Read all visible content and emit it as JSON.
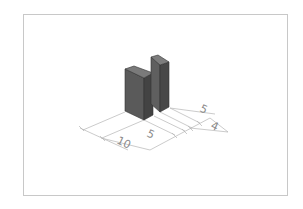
{
  "figure": {
    "type": "isometric technical drawing"
  },
  "dimensions": [
    {
      "id": "dim-10",
      "label": "10"
    },
    {
      "id": "dim-5-front",
      "label": "5"
    },
    {
      "id": "dim-5-back",
      "label": "5"
    },
    {
      "id": "dim-4",
      "label": "4"
    }
  ],
  "colors": {
    "block_front": "#5a5a5a",
    "block_side": "#454545",
    "block_top": "#7a7a7a",
    "dimension_line": "#b0b0b0",
    "frame": "#c8c8c8"
  }
}
